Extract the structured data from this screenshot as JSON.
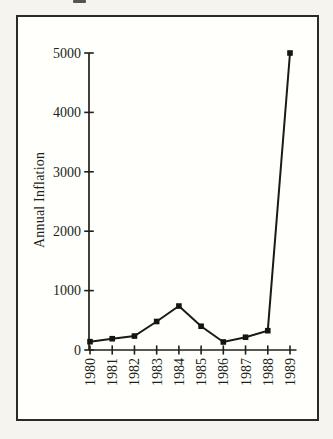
{
  "colors": {
    "ink": "#211f1b",
    "frame": "#2b2a26",
    "paper_outer": "#f6f4ee",
    "paper_inner": "#fffffc",
    "line": "#1b1a17",
    "marker": "#151412"
  },
  "chart_data": {
    "type": "line",
    "title": "",
    "xlabel": "",
    "ylabel": "Annual Inflation",
    "categories": [
      "1980",
      "1981",
      "1982",
      "1983",
      "1984",
      "1985",
      "1986",
      "1987",
      "1988",
      "1989"
    ],
    "values": [
      140,
      190,
      235,
      480,
      740,
      400,
      135,
      215,
      325,
      5000
    ],
    "y_ticks": [
      0,
      1000,
      2000,
      3000,
      4000,
      5000
    ],
    "ylim": [
      0,
      5000
    ],
    "grid": false,
    "legend": false,
    "marker": "square",
    "x_tick_label_rotation": -90
  }
}
